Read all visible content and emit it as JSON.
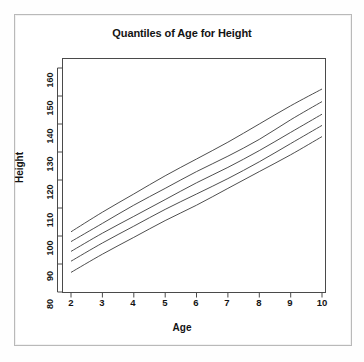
{
  "figure": {
    "frame_color": "#b9b9b9",
    "background": "#ffffff",
    "line_color": "#3a3a3a"
  },
  "chart_data": {
    "type": "line",
    "title": "Quantiles of Age for Height",
    "xlabel": "Age",
    "ylabel": "Height",
    "xlim": [
      1.7,
      10.3
    ],
    "ylim": [
      78,
      163
    ],
    "xticks": [
      2,
      3,
      4,
      5,
      6,
      7,
      8,
      9,
      10
    ],
    "xtick_labels": [
      "2",
      "3",
      "4",
      "5",
      "6",
      "7",
      "8",
      "9",
      "10"
    ],
    "yticks": [
      80,
      90,
      100,
      110,
      120,
      130,
      140,
      150,
      160
    ],
    "ytick_labels": [
      "80",
      "90",
      "100",
      "110",
      "120",
      "130",
      "140",
      "150",
      "160"
    ],
    "grid": false,
    "legend": "none",
    "x": [
      2,
      3,
      4,
      5,
      6,
      7,
      8,
      9,
      10
    ],
    "series": [
      {
        "name": "95th percentile",
        "values": [
          101.5,
          108.5,
          115.0,
          121.5,
          127.5,
          133.5,
          140.0,
          146.5,
          152.5
        ]
      },
      {
        "name": "75th percentile",
        "values": [
          98.0,
          104.5,
          111.0,
          117.0,
          123.0,
          128.5,
          134.5,
          141.5,
          148.0
        ]
      },
      {
        "name": "50th percentile",
        "values": [
          94.5,
          101.0,
          107.0,
          113.0,
          119.0,
          124.5,
          130.5,
          137.0,
          143.5
        ]
      },
      {
        "name": "25th percentile",
        "values": [
          91.0,
          97.5,
          103.5,
          109.5,
          115.0,
          120.5,
          126.5,
          133.0,
          139.5
        ]
      },
      {
        "name": "5th percentile",
        "values": [
          87.0,
          93.5,
          99.5,
          105.5,
          111.0,
          117.0,
          123.0,
          129.0,
          135.5
        ]
      }
    ]
  }
}
